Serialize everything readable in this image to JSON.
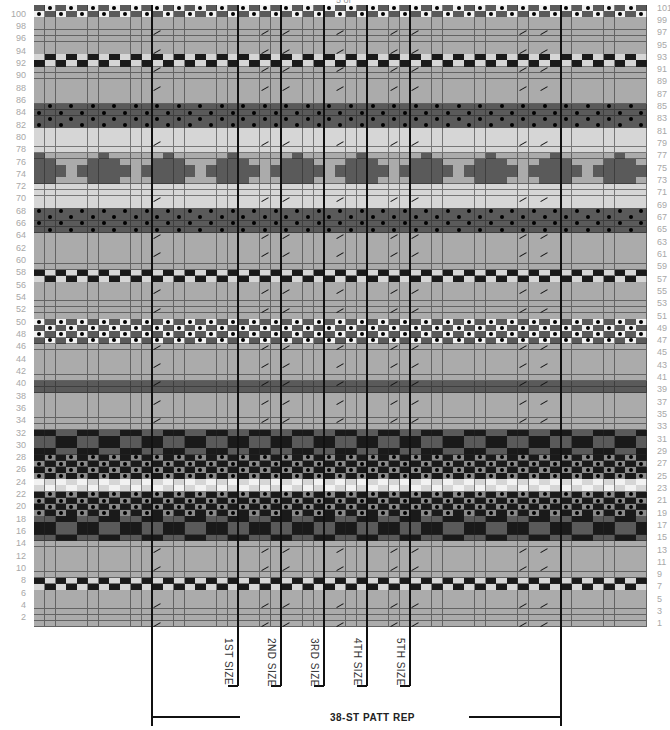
{
  "chart_data": {
    "type": "table",
    "rows": 101,
    "columns": 57,
    "row_labels_left": [
      "100",
      "98",
      "96",
      "94",
      "92",
      "90",
      "88",
      "86",
      "84",
      "82",
      "80",
      "78",
      "76",
      "74",
      "72",
      "70",
      "68",
      "66",
      "64",
      "62",
      "60",
      "58",
      "56",
      "54",
      "52",
      "50",
      "48",
      "46",
      "44",
      "42",
      "40",
      "38",
      "36",
      "34",
      "32",
      "30",
      "28",
      "26",
      "24",
      "22",
      "20",
      "18",
      "16",
      "14",
      "12",
      "10",
      "8",
      "6",
      "4",
      "2"
    ],
    "row_labels_right": [
      "101",
      "99",
      "97",
      "95",
      "93",
      "91",
      "89",
      "87",
      "85",
      "83",
      "81",
      "79",
      "77",
      "75",
      "73",
      "71",
      "69",
      "67",
      "65",
      "63",
      "61",
      "59",
      "57",
      "55",
      "53",
      "51",
      "49",
      "47",
      "45",
      "43",
      "41",
      "39",
      "37",
      "35",
      "33",
      "31",
      "29",
      "27",
      "25",
      "23",
      "21",
      "19",
      "17",
      "15",
      "13",
      "11",
      "9",
      "7",
      "5",
      "3",
      "1"
    ],
    "size_labels": [
      "1ST SIZE",
      "2ND SIZE",
      "3RD SIZE",
      "4TH SIZE",
      "5TH SIZE"
    ],
    "repeat_label": "38-ST PATT REP",
    "legend_colors": {
      "light": "#d6d6d6",
      "mid": "#ababab",
      "mid_dark": "#8a8a8a",
      "dark": "#5a5a5a",
      "black": "#1a1a1a",
      "white": "#f2f2f2"
    },
    "bands": [
      {
        "rows": [
          100,
          101
        ],
        "pattern": "dot_check_white"
      },
      {
        "rows": [
          86,
          99
        ],
        "pattern": "plain_mid",
        "except": [
          {
            "rows": [
              92,
              93
            ],
            "pattern": "checker_bw"
          }
        ]
      },
      {
        "rows": [
          82,
          85
        ],
        "pattern": "dot_dark"
      },
      {
        "rows": [
          78,
          81
        ],
        "pattern": "plain_light"
      },
      {
        "rows": [
          73,
          77
        ],
        "pattern": "diamond_dark"
      },
      {
        "rows": [
          69,
          72
        ],
        "pattern": "plain_light"
      },
      {
        "rows": [
          65,
          68
        ],
        "pattern": "dot_dark"
      },
      {
        "rows": [
          51,
          64
        ],
        "pattern": "plain_mid",
        "except": [
          {
            "rows": [
              57,
              58
            ],
            "pattern": "checker_bw"
          }
        ]
      },
      {
        "rows": [
          47,
          50
        ],
        "pattern": "dot_check_white"
      },
      {
        "rows": [
          33,
          46
        ],
        "pattern": "plain_mid",
        "except": [
          {
            "rows": [
              39,
              40
            ],
            "pattern": "plain_dark"
          }
        ]
      },
      {
        "rows": [
          15,
          32
        ],
        "pattern": "checker_black",
        "except": [
          {
            "rows": [
              19,
              22
            ],
            "pattern": "dot_black"
          },
          {
            "rows": [
              25,
              28
            ],
            "pattern": "dot_black"
          },
          {
            "rows": [
              23,
              24
            ],
            "pattern": "checker_light"
          }
        ]
      },
      {
        "rows": [
          1,
          14
        ],
        "pattern": "plain_mid",
        "except": [
          {
            "rows": [
              7,
              8
            ],
            "pattern": "checker_bw"
          }
        ]
      }
    ],
    "vertical_lines_cols": [
      11,
      19,
      23,
      27,
      31,
      35,
      49
    ],
    "slash_cols": [
      11,
      21,
      23,
      28,
      33,
      35,
      45,
      47
    ]
  },
  "labels": {
    "top_partial": "5 of"
  }
}
